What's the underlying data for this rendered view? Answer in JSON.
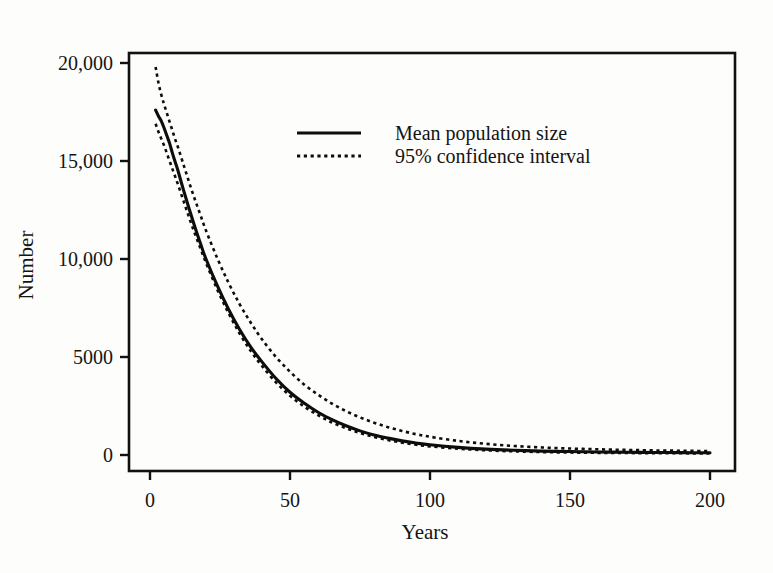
{
  "chart_data": {
    "type": "line",
    "title": "",
    "xlabel": "Years",
    "ylabel": "Number",
    "xlim": [
      0,
      200
    ],
    "ylim": [
      0,
      20000
    ],
    "xticks": [
      0,
      50,
      100,
      150,
      200
    ],
    "xtick_labels": [
      "0",
      "50",
      "100",
      "150",
      "200"
    ],
    "yticks": [
      0,
      5000,
      10000,
      15000,
      20000
    ],
    "ytick_labels": [
      "0",
      "5000",
      "10,000",
      "15,000",
      "20,000"
    ],
    "grid": false,
    "frame": "box",
    "legend_position": "upper center",
    "x": [
      2,
      3,
      4,
      5,
      6,
      7,
      8,
      9,
      10,
      12,
      14,
      16,
      18,
      20,
      24,
      28,
      32,
      36,
      40,
      45,
      50,
      55,
      60,
      65,
      70,
      75,
      80,
      85,
      90,
      95,
      100,
      110,
      120,
      130,
      140,
      150,
      160,
      170,
      180,
      190,
      200
    ],
    "series": [
      {
        "name": "Mean population size",
        "style": "solid",
        "color": "#0d0d0d",
        "values": [
          17600,
          17300,
          17050,
          16700,
          16300,
          15900,
          15400,
          14950,
          14500,
          13500,
          12550,
          11650,
          10800,
          10000,
          8650,
          7450,
          6400,
          5500,
          4750,
          3900,
          3200,
          2650,
          2180,
          1800,
          1490,
          1230,
          1020,
          860,
          720,
          610,
          520,
          390,
          300,
          240,
          200,
          175,
          155,
          140,
          130,
          120,
          115
        ]
      },
      {
        "name": "95% confidence interval upper",
        "style": "dotted",
        "color": "#0d0d0d",
        "values": [
          19800,
          19000,
          18400,
          17900,
          17450,
          17000,
          16550,
          16100,
          15700,
          14800,
          13900,
          13050,
          12250,
          11450,
          10050,
          8800,
          7700,
          6750,
          5900,
          5000,
          4250,
          3600,
          3080,
          2620,
          2240,
          1920,
          1650,
          1420,
          1230,
          1060,
          930,
          720,
          570,
          460,
          385,
          330,
          290,
          260,
          235,
          215,
          200
        ]
      },
      {
        "name": "95% confidence interval lower",
        "style": "dotted",
        "color": "#0d0d0d",
        "values": [
          16900,
          16500,
          16150,
          15800,
          15400,
          15000,
          14600,
          14200,
          13800,
          12950,
          12100,
          11300,
          10550,
          9800,
          8450,
          7250,
          6200,
          5300,
          4540,
          3700,
          3020,
          2480,
          2030,
          1660,
          1370,
          1120,
          920,
          760,
          630,
          525,
          440,
          320,
          240,
          185,
          150,
          125,
          110,
          100,
          92,
          86,
          82
        ]
      }
    ],
    "legend": [
      {
        "label": "Mean population size",
        "style": "solid"
      },
      {
        "label": "95% confidence interval",
        "style": "dotted"
      }
    ]
  },
  "figure": {
    "background_color": "#fdfdfc",
    "ink_color": "#0d0d0d"
  }
}
